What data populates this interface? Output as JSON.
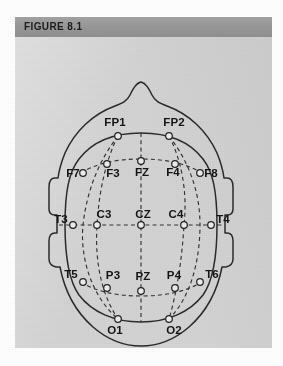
{
  "figure": {
    "header_label": "FIGURE 8.1",
    "header_bg": "#9a9a9a",
    "panel_bg": "#d4d4d4",
    "stroke_color": "#2b2b2b",
    "electrode_fill": "#ededed",
    "diagram_name": "international-10-20-eeg-electrode-placement"
  },
  "electrodes": [
    {
      "id": "FP1",
      "label": "FP1",
      "cx": 103,
      "cy": 99,
      "lx": 100,
      "ly": 89,
      "anchor": "middle"
    },
    {
      "id": "FP2",
      "label": "FP2",
      "cx": 154,
      "cy": 99,
      "lx": 159,
      "ly": 89,
      "anchor": "middle"
    },
    {
      "id": "F7",
      "label": "F7",
      "cx": 68,
      "cy": 136,
      "lx": 58,
      "ly": 140,
      "anchor": "middle"
    },
    {
      "id": "F3",
      "label": "F3",
      "cx": 92,
      "cy": 127,
      "lx": 98,
      "ly": 140,
      "anchor": "middle"
    },
    {
      "id": "FZ",
      "label": "FZ",
      "cx": 126,
      "cy": 124,
      "lx": 127,
      "ly": 139,
      "anchor": "middle"
    },
    {
      "id": "F4",
      "label": "F4",
      "cx": 160,
      "cy": 127,
      "lx": 158,
      "ly": 139,
      "anchor": "middle"
    },
    {
      "id": "F8",
      "label": "F8",
      "cx": 185,
      "cy": 136,
      "lx": 196,
      "ly": 140,
      "anchor": "middle"
    },
    {
      "id": "T3",
      "label": "T3",
      "cx": 58,
      "cy": 188,
      "lx": 46,
      "ly": 186,
      "anchor": "middle"
    },
    {
      "id": "C3",
      "label": "C3",
      "cx": 82,
      "cy": 188,
      "lx": 89,
      "ly": 181,
      "anchor": "middle"
    },
    {
      "id": "CZ",
      "label": "CZ",
      "cx": 126,
      "cy": 188,
      "lx": 128,
      "ly": 181,
      "anchor": "middle"
    },
    {
      "id": "C4",
      "label": "C4",
      "cx": 169,
      "cy": 188,
      "lx": 161,
      "ly": 181,
      "anchor": "middle"
    },
    {
      "id": "T4",
      "label": "T4",
      "cx": 196,
      "cy": 188,
      "lx": 208,
      "ly": 186,
      "anchor": "middle"
    },
    {
      "id": "T5",
      "label": "T5",
      "cx": 68,
      "cy": 245,
      "lx": 56,
      "ly": 241,
      "anchor": "middle"
    },
    {
      "id": "P3",
      "label": "P3",
      "cx": 92,
      "cy": 251,
      "lx": 98,
      "ly": 242,
      "anchor": "middle"
    },
    {
      "id": "PZ",
      "label": "PZ",
      "cx": 126,
      "cy": 254,
      "lx": 128,
      "ly": 243,
      "anchor": "middle"
    },
    {
      "id": "P4",
      "label": "P4",
      "cx": 160,
      "cy": 251,
      "lx": 159,
      "ly": 242,
      "anchor": "middle"
    },
    {
      "id": "T6",
      "label": "T6",
      "cx": 185,
      "cy": 245,
      "lx": 197,
      "ly": 241,
      "anchor": "middle"
    },
    {
      "id": "O1",
      "label": "O1",
      "cx": 103,
      "cy": 282,
      "lx": 100,
      "ly": 297,
      "anchor": "middle"
    },
    {
      "id": "O2",
      "label": "O2",
      "cx": 154,
      "cy": 282,
      "lx": 159,
      "ly": 297,
      "anchor": "middle"
    }
  ],
  "geometry": {
    "head_path": "M 126 45 C 121 46 118 52 115 58 C 112 64 108 66 100 69 C 78 77 60 94 50 116 C 46 126 44 133 43 141 L 40 141 C 36 141 34 144 34 150 L 34 172 C 34 176 36 178 40 178 L 42 178 L 42 196 L 40 196 C 36 196 34 199 34 204 L 34 222 C 34 227 37 229 41 230 L 45 230 C 50 256 62 276 78 290 C 93 303 109 309 126 309 C 143 309 159 303 174 290 C 190 276 202 256 207 230 L 211 230 C 215 229 218 227 218 222 L 218 204 C 218 199 216 196 212 196 L 210 196 L 210 178 L 212 178 C 216 178 218 176 218 172 L 218 150 C 218 144 216 141 212 141 L 209 141 C 208 133 206 126 202 116 C 192 94 174 77 152 69 C 144 66 140 64 137 58 C 134 52 131 46 126 45 Z",
    "inner_ring": "M 126 96 C 153 96 175 105 188 122 C 198 135 202 154 202 188 C 202 222 198 244 188 258 C 175 275 153 285 126 285 C 99 285 77 275 64 258 C 54 244 50 222 50 188 C 50 154 54 135 64 122 C 77 105 99 96 126 96 Z",
    "grid_lines": [
      {
        "name": "midline-sagittal",
        "d": "M 126 96 L 126 285"
      },
      {
        "name": "row-central-C",
        "d": "M 44 188 L 208 188"
      },
      {
        "name": "row-frontal-F",
        "d": "M 66 136 C 80 127 100 122 126 122 C 152 122 172 127 187 136"
      },
      {
        "name": "row-parietal-P",
        "d": "M 66 245 C 80 254 100 259 126 259 C 152 259 172 254 187 245"
      },
      {
        "name": "meridian-left",
        "d": "M 103 99 C 92 120 84 152 82 188 C 80 222 85 255 103 282"
      },
      {
        "name": "meridian-right",
        "d": "M 154 99 C 165 120 173 152 169 188 C 167 222 162 255 154 282"
      },
      {
        "name": "meridian-left-outer",
        "d": "M 103 99 C 85 122 72 152 68 188 C 65 218 75 258 103 282"
      },
      {
        "name": "meridian-right-outer",
        "d": "M 154 99 C 172 122 185 152 185 188 C 185 218 178 258 154 282"
      }
    ]
  }
}
